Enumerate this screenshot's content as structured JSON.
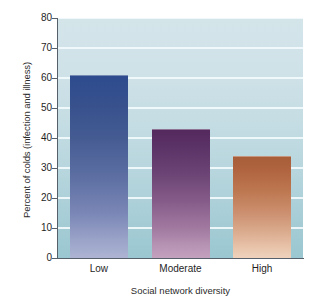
{
  "chart_data": {
    "type": "bar",
    "title": "",
    "categories": [
      "Low",
      "Moderate",
      "High"
    ],
    "values": [
      61,
      43,
      34
    ],
    "xlabel": "Social network diversity",
    "ylabel": "Percent of colds (infection and illness)",
    "ylim": [
      0,
      80
    ],
    "yticks": [
      0,
      10,
      20,
      30,
      40,
      50,
      60,
      70,
      80
    ],
    "ytick_labels": [
      "0",
      "10",
      "20",
      "30",
      "40",
      "50",
      "60",
      "70",
      "80"
    ],
    "grid": true,
    "grid_axis": "y",
    "legend": false,
    "legend_position": "none",
    "series": [
      {
        "name": "Percent of colds (infection and illness)",
        "values": [
          61,
          43,
          34
        ]
      }
    ],
    "bar_colors": [
      "#2d4b8e",
      "#542a5e",
      "#a85d3a"
    ],
    "bar_colors_bottom": [
      "#adb4d3",
      "#c3a2be",
      "#efd2bc"
    ],
    "plot_background": "#c4dce3",
    "gridline_color": "#f2fafc",
    "axis_color": "#56606a"
  },
  "axis": {
    "y_title": "Percent of colds (infection and illness)",
    "x_title": "Social network diversity",
    "y_ticks": [
      {
        "label": "80",
        "value": 80
      },
      {
        "label": "70",
        "value": 70
      },
      {
        "label": "60",
        "value": 60
      },
      {
        "label": "50",
        "value": 50
      },
      {
        "label": "40",
        "value": 40
      },
      {
        "label": "30",
        "value": 30
      },
      {
        "label": "20",
        "value": 20
      },
      {
        "label": "10",
        "value": 10
      },
      {
        "label": "0",
        "value": 0
      }
    ],
    "x_ticks": [
      {
        "label": "Low"
      },
      {
        "label": "Moderate"
      },
      {
        "label": "High"
      }
    ]
  }
}
